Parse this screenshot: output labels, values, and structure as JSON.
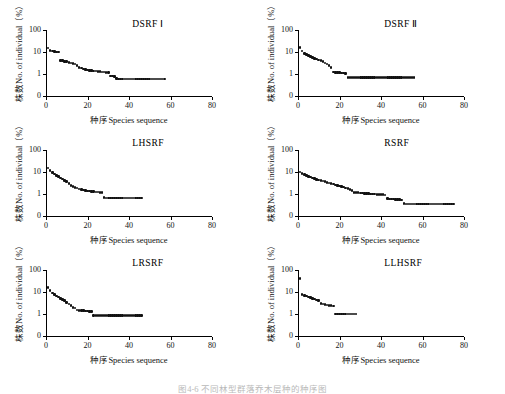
{
  "figure": {
    "caption": "图4-6  不同林型群落乔木层种的种序图",
    "axis": {
      "x_title": "种序Species sequence",
      "y_title": "株数No. of individual（%）",
      "x_ticks": [
        "0",
        "20",
        "40",
        "60",
        "80"
      ],
      "y_ticks": [
        "0",
        "1",
        "10",
        "100"
      ]
    }
  },
  "chart_data": [
    {
      "type": "scatter",
      "title": "DSRF Ⅰ",
      "xlabel": "种序Species sequence",
      "ylabel": "株数No. of individual（%）",
      "xlim": [
        0,
        80
      ],
      "ylim_log": [
        0.3,
        100
      ],
      "ytick_values": [
        0,
        1,
        10,
        100
      ],
      "xtick_values": [
        0,
        20,
        40,
        60,
        80
      ],
      "grid": false,
      "legend": "none",
      "marker": "filled-diamond",
      "color": "#111111",
      "n_points": 57,
      "x": [
        1,
        2,
        3,
        4,
        5,
        6,
        7,
        8,
        9,
        10,
        11,
        12,
        13,
        14,
        15,
        16,
        17,
        18,
        19,
        20,
        21,
        22,
        23,
        24,
        25,
        26,
        27,
        28,
        29,
        30,
        31,
        32,
        33,
        34,
        35,
        36,
        37,
        38,
        39,
        40,
        41,
        42,
        43,
        44,
        45,
        46,
        47,
        48,
        49,
        50,
        51,
        52,
        53,
        54,
        55,
        56,
        57
      ],
      "y": [
        15.5,
        12.0,
        11.0,
        10.6,
        10.2,
        9.8,
        4.2,
        4.0,
        3.8,
        3.6,
        3.4,
        3.2,
        3.0,
        2.8,
        2.5,
        2.0,
        1.85,
        1.7,
        1.6,
        1.5,
        1.45,
        1.4,
        1.38,
        1.35,
        1.3,
        1.28,
        1.25,
        1.22,
        1.2,
        1.18,
        0.82,
        0.8,
        0.78,
        0.62,
        0.6,
        0.6,
        0.6,
        0.6,
        0.6,
        0.6,
        0.6,
        0.6,
        0.6,
        0.6,
        0.6,
        0.6,
        0.6,
        0.6,
        0.6,
        0.6,
        0.6,
        0.6,
        0.6,
        0.6,
        0.6,
        0.6,
        0.6
      ]
    },
    {
      "type": "scatter",
      "title": "DSRF Ⅱ",
      "xlabel": "种序Species sequence",
      "ylabel": "株数No. of individual（%）",
      "xlim": [
        0,
        80
      ],
      "ylim_log": [
        0.3,
        100
      ],
      "ytick_values": [
        0,
        1,
        10,
        100
      ],
      "xtick_values": [
        0,
        20,
        40,
        60,
        80
      ],
      "grid": false,
      "legend": "none",
      "marker": "filled-diamond",
      "color": "#111111",
      "n_points": 56,
      "x": [
        1,
        2,
        3,
        4,
        5,
        6,
        7,
        8,
        9,
        10,
        11,
        12,
        13,
        14,
        15,
        16,
        17,
        18,
        19,
        20,
        21,
        22,
        23,
        24,
        25,
        26,
        27,
        28,
        29,
        30,
        31,
        32,
        33,
        34,
        35,
        36,
        37,
        38,
        39,
        40,
        41,
        42,
        43,
        44,
        45,
        46,
        47,
        48,
        49,
        50,
        51,
        52,
        53,
        54,
        55,
        56
      ],
      "y": [
        16.0,
        11.0,
        8.5,
        7.5,
        6.8,
        6.2,
        5.6,
        5.2,
        4.8,
        4.4,
        4.0,
        3.6,
        3.2,
        2.9,
        2.4,
        2.0,
        1.25,
        1.2,
        1.18,
        1.15,
        1.12,
        1.1,
        1.08,
        0.7,
        0.7,
        0.7,
        0.7,
        0.7,
        0.7,
        0.7,
        0.7,
        0.7,
        0.7,
        0.7,
        0.7,
        0.7,
        0.7,
        0.7,
        0.7,
        0.7,
        0.7,
        0.7,
        0.7,
        0.7,
        0.7,
        0.7,
        0.7,
        0.7,
        0.7,
        0.7,
        0.7,
        0.7,
        0.7,
        0.7,
        0.7,
        0.7
      ]
    },
    {
      "type": "scatter",
      "title": "LHSRF",
      "xlabel": "种序Species sequence",
      "ylabel": "株数No. of individual（%）",
      "xlim": [
        0,
        80
      ],
      "ylim_log": [
        0.3,
        100
      ],
      "ytick_values": [
        0,
        1,
        10,
        100
      ],
      "xtick_values": [
        0,
        20,
        40,
        60,
        80
      ],
      "grid": false,
      "legend": "none",
      "marker": "filled-diamond",
      "color": "#111111",
      "n_points": 46,
      "x": [
        1,
        2,
        3,
        4,
        5,
        6,
        7,
        8,
        9,
        10,
        11,
        12,
        13,
        14,
        15,
        16,
        17,
        18,
        19,
        20,
        21,
        22,
        23,
        24,
        25,
        26,
        27,
        28,
        29,
        30,
        31,
        32,
        33,
        34,
        35,
        36,
        37,
        38,
        39,
        40,
        41,
        42,
        43,
        44,
        45,
        46
      ],
      "y": [
        15.0,
        12.0,
        9.5,
        8.0,
        7.0,
        6.2,
        5.4,
        4.8,
        4.2,
        3.6,
        3.0,
        2.5,
        2.2,
        2.0,
        1.85,
        1.7,
        1.6,
        1.5,
        1.42,
        1.38,
        1.35,
        1.3,
        1.28,
        1.25,
        1.22,
        1.2,
        1.18,
        0.68,
        0.66,
        0.65,
        0.65,
        0.65,
        0.65,
        0.65,
        0.65,
        0.65,
        0.65,
        0.65,
        0.65,
        0.65,
        0.65,
        0.65,
        0.65,
        0.65,
        0.65,
        0.65
      ]
    },
    {
      "type": "scatter",
      "title": "RSRF",
      "xlabel": "种序Species sequence",
      "ylabel": "株数No. of individual（%）",
      "xlim": [
        0,
        80
      ],
      "ylim_log": [
        0.3,
        100
      ],
      "ytick_values": [
        0,
        1,
        10,
        100
      ],
      "xtick_values": [
        0,
        20,
        40,
        60,
        80
      ],
      "grid": false,
      "legend": "none",
      "marker": "filled-diamond",
      "color": "#111111",
      "n_points": 75,
      "x": [
        1,
        2,
        3,
        4,
        5,
        6,
        7,
        8,
        9,
        10,
        11,
        12,
        13,
        14,
        15,
        16,
        17,
        18,
        19,
        20,
        21,
        22,
        23,
        24,
        25,
        26,
        27,
        28,
        29,
        30,
        31,
        32,
        33,
        34,
        35,
        36,
        37,
        38,
        39,
        40,
        41,
        42,
        43,
        44,
        45,
        46,
        47,
        48,
        49,
        50,
        51,
        52,
        53,
        54,
        55,
        56,
        57,
        58,
        59,
        60,
        61,
        62,
        63,
        64,
        65,
        66,
        67,
        68,
        69,
        70,
        71,
        72,
        73,
        74,
        75
      ],
      "y": [
        10.0,
        8.5,
        7.5,
        6.8,
        6.2,
        5.8,
        5.4,
        5.0,
        4.7,
        4.4,
        4.1,
        3.9,
        3.6,
        3.4,
        3.2,
        3.0,
        2.8,
        2.6,
        2.45,
        2.3,
        2.2,
        2.05,
        1.9,
        1.75,
        1.6,
        1.45,
        1.2,
        1.18,
        1.15,
        1.12,
        1.1,
        1.08,
        1.06,
        1.04,
        1.02,
        1.0,
        0.98,
        0.96,
        0.95,
        0.94,
        0.92,
        0.9,
        0.62,
        0.6,
        0.6,
        0.58,
        0.57,
        0.56,
        0.55,
        0.54,
        0.36,
        0.35,
        0.35,
        0.35,
        0.35,
        0.35,
        0.35,
        0.35,
        0.35,
        0.35,
        0.35,
        0.35,
        0.35,
        0.35,
        0.35,
        0.35,
        0.35,
        0.35,
        0.35,
        0.35,
        0.35,
        0.35,
        0.35,
        0.35,
        0.35
      ]
    },
    {
      "type": "scatter",
      "title": "LRSRF",
      "xlabel": "种序Species sequence",
      "ylabel": "株数No. of individual（%）",
      "xlim": [
        0,
        80
      ],
      "ylim_log": [
        0.3,
        100
      ],
      "ytick_values": [
        0,
        1,
        10,
        100
      ],
      "xtick_values": [
        0,
        20,
        40,
        60,
        80
      ],
      "grid": false,
      "legend": "none",
      "marker": "filled-diamond",
      "color": "#111111",
      "n_points": 46,
      "x": [
        1,
        2,
        3,
        4,
        5,
        6,
        7,
        8,
        9,
        10,
        11,
        12,
        13,
        14,
        15,
        16,
        17,
        18,
        19,
        20,
        21,
        22,
        23,
        24,
        25,
        26,
        27,
        28,
        29,
        30,
        31,
        32,
        33,
        34,
        35,
        36,
        37,
        38,
        39,
        40,
        41,
        42,
        43,
        44,
        45,
        46
      ],
      "y": [
        16.0,
        12.0,
        9.0,
        7.5,
        6.5,
        5.8,
        5.2,
        4.6,
        4.0,
        3.4,
        2.9,
        2.4,
        2.0,
        1.9,
        1.5,
        1.45,
        1.42,
        1.4,
        1.38,
        1.35,
        1.32,
        1.3,
        0.85,
        0.85,
        0.85,
        0.85,
        0.85,
        0.85,
        0.85,
        0.85,
        0.85,
        0.85,
        0.85,
        0.85,
        0.85,
        0.85,
        0.85,
        0.85,
        0.85,
        0.85,
        0.85,
        0.85,
        0.85,
        0.85,
        0.85,
        0.85
      ]
    },
    {
      "type": "scatter",
      "title": "LLHSRF",
      "xlabel": "种序Species sequence",
      "ylabel": "株数No. of individual（%）",
      "xlim": [
        0,
        80
      ],
      "ylim_log": [
        0.3,
        100
      ],
      "ytick_values": [
        0,
        1,
        10,
        100
      ],
      "xtick_values": [
        0,
        20,
        40,
        60,
        80
      ],
      "grid": false,
      "legend": "none",
      "marker": "filled-diamond",
      "color": "#111111",
      "n_points": 28,
      "x": [
        1,
        2,
        3,
        4,
        5,
        6,
        7,
        8,
        9,
        10,
        11,
        12,
        13,
        14,
        15,
        16,
        17,
        18,
        19,
        20,
        21,
        22,
        23,
        24,
        25,
        26,
        27,
        28
      ],
      "y": [
        42.0,
        7.5,
        7.0,
        6.5,
        6.0,
        5.6,
        5.2,
        4.8,
        4.4,
        4.0,
        3.0,
        2.8,
        2.7,
        2.6,
        2.5,
        2.4,
        2.3,
        1.0,
        1.0,
        1.0,
        1.0,
        1.0,
        1.0,
        1.0,
        1.0,
        1.0,
        1.0,
        1.0
      ]
    }
  ]
}
